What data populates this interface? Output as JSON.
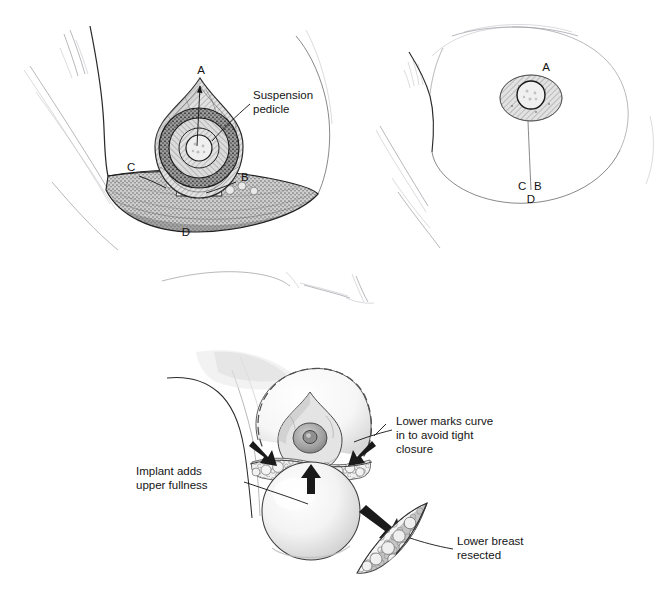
{
  "document": {
    "type": "medical-surgical-illustration",
    "subject": "Breast reduction with suspension pedicle and implant augmentation",
    "background_color": "#ffffff",
    "ink_color": "#141414",
    "style": "grayscale pen-and-ink medical line drawing with stipple and hatch shading"
  },
  "palette": {
    "ink": "#141414",
    "outline": "#2b2b2b",
    "leader_line": "#121212",
    "faint_sketch": "#9a9aa0",
    "tissue_mid_gray": "#8e8e8e",
    "tissue_light_gray": "#d9d9d9",
    "tissue_dark_gray": "#6a6a6a",
    "implant_fill": "#f2f2f2",
    "areola_gray": "#b8b8b8",
    "nipple_gray": "#9c9c9c",
    "dashed_marking": "#5c5c5c",
    "arrow_fill": "#1a1a1a"
  },
  "panels": [
    {
      "id": "panel-upper-left",
      "name": "oblique-view-markings",
      "description": "Oblique view of breast showing teardrop suspension pedicle above a crescent of lower breast tissue to be resected",
      "labels": [
        {
          "key": "A",
          "text": "A",
          "x": 201,
          "y": 74,
          "role": "apex-of-pedicle"
        },
        {
          "key": "B",
          "text": "B",
          "x": 241,
          "y": 181,
          "role": "lateral-pillar-point"
        },
        {
          "key": "C",
          "text": "C",
          "x": 131,
          "y": 171,
          "role": "medial-pillar-point"
        },
        {
          "key": "D",
          "text": "D",
          "x": 186,
          "y": 232,
          "role": "inframammary-point"
        }
      ],
      "callouts": [
        {
          "name": "suspension-pedicle",
          "lines": [
            "Suspension",
            "pedicle"
          ],
          "text_x": 253,
          "text_y": 99,
          "leader": "from text left edge down-left to the pedicle ring"
        }
      ]
    },
    {
      "id": "panel-upper-right",
      "name": "frontal-view-markings",
      "description": "Frontal view of breast with the planned incision marks A, B, C and D",
      "labels": [
        {
          "key": "A",
          "text": "A",
          "x": 546,
          "y": 71,
          "role": "apex-of-pedicle"
        },
        {
          "key": "C",
          "text": "C",
          "x": 524,
          "y": 187,
          "role": "medial-pillar-point"
        },
        {
          "key": "B",
          "text": "B",
          "x": 539,
          "y": 187,
          "role": "lateral-pillar-point"
        },
        {
          "key": "D",
          "text": "D",
          "x": 531,
          "y": 199,
          "role": "inframammary-point"
        }
      ],
      "callouts": []
    },
    {
      "id": "panel-lower",
      "name": "implant-and-resection",
      "description": "Lower figure showing implant adding upper fullness, lower marks curving in, and the resected crescent of lower breast",
      "labels": [],
      "callouts": [
        {
          "name": "implant-adds-upper-fullness",
          "lines": [
            "Implant adds",
            "upper fullness"
          ],
          "text_x": 136,
          "text_y": 475,
          "align": "start",
          "leader": "horizontal leader to the implant sphere"
        },
        {
          "name": "lower-marks-curve-in",
          "lines": [
            "Lower marks curve",
            "in to avoid tight",
            "closure"
          ],
          "text_x": 396,
          "text_y": 425,
          "align": "start",
          "leader": "leader to the lower curved marks of the breast"
        },
        {
          "name": "lower-breast-resected",
          "lines": [
            "Lower breast",
            "resected"
          ],
          "text_x": 457,
          "text_y": 545,
          "align": "start",
          "leader": "leader to the crescent of resected tissue"
        }
      ],
      "arrows": [
        {
          "name": "implant-up-arrow",
          "direction": "up",
          "meaning": "implant pushes upper pole"
        },
        {
          "name": "left-converging-arrow",
          "direction": "down-right",
          "meaning": "lower mark curves in"
        },
        {
          "name": "right-converging-arrow",
          "direction": "down-left",
          "meaning": "lower mark curves in"
        },
        {
          "name": "resection-transfer-arrow",
          "direction": "down-right",
          "meaning": "tissue removed"
        }
      ]
    }
  ]
}
